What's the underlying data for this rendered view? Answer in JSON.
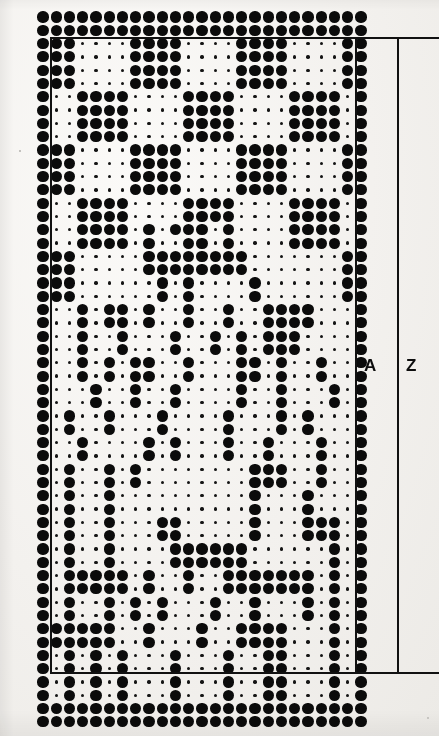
{
  "figure": {
    "kind": "dot-matrix",
    "columns": 25,
    "rows": 53,
    "dot_large_color": "#0a0a0a",
    "dot_small_color": "#141414",
    "background_color": "#f3f1ee",
    "rule_color": "#111111",
    "grid": {
      "origin_x": 43.0,
      "origin_y": 17.0,
      "step_x": 13.25,
      "step_y": 13.3,
      "big_radius": 5.6,
      "small_radius": 1.7
    }
  },
  "labels": {
    "a": "A",
    "z": "Z"
  },
  "annotations": {
    "inner_box": {
      "x": 50,
      "y": 37,
      "width": 306,
      "height": 637
    },
    "outer_bracket": {
      "x": 397,
      "y": 37,
      "height": 637,
      "tick_width": 42
    },
    "a_label_pos": {
      "x": 364,
      "y": 358
    },
    "z_label_pos": {
      "x": 406,
      "y": 358
    }
  },
  "matrix": [
    "1111111111111111111111111",
    "1111111111111111111111111",
    "1110000111100001111000011",
    "1110000111100001111000011",
    "1110000111100001111000011",
    "1110000111100001111000011",
    "1001111000011110000111101",
    "1001111000011110000111101",
    "1001111000011110000111101",
    "1001111000011110000111101",
    "1110000111100001111000011",
    "1110000111100001111000011",
    "1110000111100001111000011",
    "1110000111100001111000011",
    "1001111000011110000111101",
    "1001111000011110000111101",
    "1001111010111010000111101",
    "1001111010011010000111101",
    "1110000011111111000000011",
    "1110000011111111000000011",
    "1110000001010000100000011",
    "1110000001010000100000011",
    "1001011010010010011110001",
    "1001011010010010011110001",
    "1001001000100101011100001",
    "1001001000100101011100001",
    "1001010110010001101001001",
    "1001010110010001101001001",
    "1000100100100001001000101",
    "1000100100100001001000101",
    "1010010001000010001010001",
    "1010010001000010001010001",
    "1001000010100010010001001",
    "1001000010100010010001001",
    "1010010100000000111001001",
    "1010010100000000111001001",
    "1010010000000000100010001",
    "1010010000000000100010001",
    "1010010001100000100011101",
    "1010010001100000100011101",
    "1010010000111111000000101",
    "1010010000111111000000101",
    "1011111010010011111110101",
    "1011111010010011111110101",
    "1010010101000100100010101",
    "1010010101000100100010101",
    "1111110010001001111000101",
    "1111110010001001111000101",
    "1010101000100010011000101",
    "1010101000100010011000101",
    "1010101000100010011000101",
    "1010101000100010011000101",
    "1111111111111111111111111",
    "1111111111111111111111111"
  ]
}
